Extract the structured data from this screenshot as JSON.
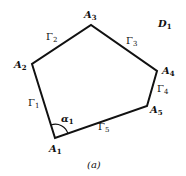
{
  "diagram": {
    "title_region": "D",
    "title_region_sub": "1",
    "caption": "(a)",
    "vertices": [
      {
        "name": "A",
        "sub": "1",
        "x": 55,
        "y": 138
      },
      {
        "name": "A",
        "sub": "2",
        "x": 32,
        "y": 64
      },
      {
        "name": "A",
        "sub": "3",
        "x": 91,
        "y": 25
      },
      {
        "name": "A",
        "sub": "4",
        "x": 157,
        "y": 71
      },
      {
        "name": "A",
        "sub": "5",
        "x": 147,
        "y": 106
      }
    ],
    "edges": [
      {
        "name": "Γ",
        "sub": "1"
      },
      {
        "name": "Γ",
        "sub": "2"
      },
      {
        "name": "Γ",
        "sub": "3"
      },
      {
        "name": "Γ",
        "sub": "4"
      },
      {
        "name": "Γ",
        "sub": "5"
      }
    ],
    "angle": {
      "name": "α",
      "sub": "1"
    }
  }
}
